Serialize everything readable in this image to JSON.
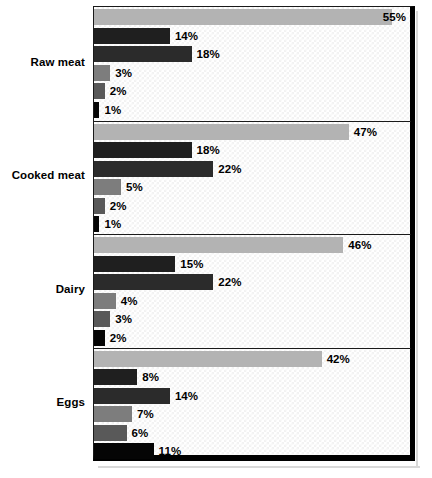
{
  "chart_data": {
    "type": "bar",
    "orientation": "horizontal",
    "title": "",
    "subtitle": "",
    "xlabel": "",
    "ylabel": "",
    "xlim": [
      0,
      58
    ],
    "grid": false,
    "legend_position": "none",
    "background_pattern": "faint-checkerboard",
    "value_suffix": "%",
    "categories": [
      "Raw meat",
      "Cooked meat",
      "Dairy",
      "Eggs"
    ],
    "series": [
      {
        "name": "series-1",
        "color": "#b3b3b3",
        "values": [
          55,
          47,
          46,
          42
        ]
      },
      {
        "name": "series-2",
        "color": "#1f1f1f",
        "values": [
          14,
          18,
          15,
          8
        ]
      },
      {
        "name": "series-3",
        "color": "#2b2b2b",
        "values": [
          18,
          22,
          22,
          14
        ]
      },
      {
        "name": "series-4",
        "color": "#7d7d7d",
        "values": [
          3,
          5,
          4,
          7
        ]
      },
      {
        "name": "series-5",
        "color": "#595959",
        "values": [
          2,
          2,
          3,
          6
        ]
      },
      {
        "name": "series-6",
        "color": "#050505",
        "values": [
          1,
          1,
          2,
          11
        ]
      }
    ],
    "groups": [
      {
        "label": "Raw meat",
        "bars": [
          {
            "value": 55,
            "label": "55%",
            "color": "#b3b3b3"
          },
          {
            "value": 14,
            "label": "14%",
            "color": "#1f1f1f"
          },
          {
            "value": 18,
            "label": "18%",
            "color": "#2b2b2b"
          },
          {
            "value": 3,
            "label": "3%",
            "color": "#7d7d7d"
          },
          {
            "value": 2,
            "label": "2%",
            "color": "#595959"
          },
          {
            "value": 1,
            "label": "1%",
            "color": "#050505"
          }
        ]
      },
      {
        "label": "Cooked meat",
        "bars": [
          {
            "value": 47,
            "label": "47%",
            "color": "#b3b3b3"
          },
          {
            "value": 18,
            "label": "18%",
            "color": "#1f1f1f"
          },
          {
            "value": 22,
            "label": "22%",
            "color": "#2b2b2b"
          },
          {
            "value": 5,
            "label": "5%",
            "color": "#7d7d7d"
          },
          {
            "value": 2,
            "label": "2%",
            "color": "#595959"
          },
          {
            "value": 1,
            "label": "1%",
            "color": "#050505"
          }
        ]
      },
      {
        "label": "Dairy",
        "bars": [
          {
            "value": 46,
            "label": "46%",
            "color": "#b3b3b3"
          },
          {
            "value": 15,
            "label": "15%",
            "color": "#1f1f1f"
          },
          {
            "value": 22,
            "label": "22%",
            "color": "#2b2b2b"
          },
          {
            "value": 4,
            "label": "4%",
            "color": "#7d7d7d"
          },
          {
            "value": 3,
            "label": "3%",
            "color": "#595959"
          },
          {
            "value": 2,
            "label": "2%",
            "color": "#050505"
          }
        ]
      },
      {
        "label": "Eggs",
        "bars": [
          {
            "value": 42,
            "label": "42%",
            "color": "#b3b3b3"
          },
          {
            "value": 8,
            "label": "8%",
            "color": "#1f1f1f"
          },
          {
            "value": 14,
            "label": "14%",
            "color": "#2b2b2b"
          },
          {
            "value": 7,
            "label": "7%",
            "color": "#7d7d7d"
          },
          {
            "value": 6,
            "label": "6%",
            "color": "#595959"
          },
          {
            "value": 11,
            "label": "11%",
            "color": "#050505"
          }
        ]
      }
    ]
  },
  "layout": {
    "plot_left": 94,
    "plot_top": 7,
    "plot_right": 410,
    "px_per_percent": 5.42,
    "group_height": 113.5,
    "bar_height": 16,
    "bar_gap": 2.5,
    "group_first_top": 9
  }
}
